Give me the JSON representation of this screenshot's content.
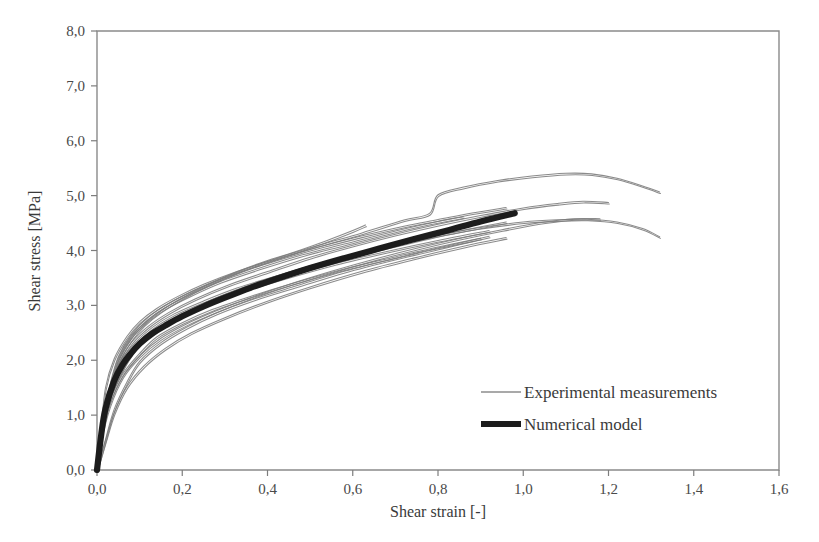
{
  "chart_data": {
    "type": "line",
    "title": "",
    "xlabel": "Shear strain [-]",
    "ylabel": "Shear stress [MPa]",
    "xlim": [
      0.0,
      1.6
    ],
    "ylim": [
      0.0,
      8.0
    ],
    "xticks": [
      "0,0",
      "0,2",
      "0,4",
      "0,6",
      "0,8",
      "1,0",
      "1,2",
      "1,4",
      "1,6"
    ],
    "xtick_values": [
      0.0,
      0.2,
      0.4,
      0.6,
      0.8,
      1.0,
      1.2,
      1.4,
      1.6
    ],
    "yticks": [
      "0,0",
      "1,0",
      "2,0",
      "3,0",
      "4,0",
      "5,0",
      "6,0",
      "7,0",
      "8,0"
    ],
    "ytick_values": [
      0.0,
      1.0,
      2.0,
      3.0,
      4.0,
      5.0,
      6.0,
      7.0,
      8.0
    ],
    "grid": false,
    "legend_position": "center-right",
    "legend": [
      {
        "label": "Experimental measurements",
        "style": "thin-line",
        "color": "#8d8d8d"
      },
      {
        "label": "Numerical model",
        "style": "thick-line",
        "color": "#1c1c1c"
      }
    ],
    "series": [
      {
        "name": "Numerical model",
        "style": "thick-line",
        "color": "#1c1c1c",
        "x": [
          0.0,
          0.01,
          0.02,
          0.04,
          0.06,
          0.08,
          0.1,
          0.13,
          0.16,
          0.2,
          0.25,
          0.3,
          0.36,
          0.42,
          0.5,
          0.58,
          0.66,
          0.74,
          0.82,
          0.9,
          0.98
        ],
        "y": [
          0.0,
          0.65,
          1.12,
          1.62,
          1.92,
          2.13,
          2.3,
          2.49,
          2.63,
          2.8,
          2.98,
          3.14,
          3.32,
          3.48,
          3.68,
          3.86,
          4.03,
          4.2,
          4.36,
          4.53,
          4.68
        ]
      },
      {
        "name": "Experimental measurement 1",
        "style": "thin-line",
        "color": "#7b7b7b",
        "x": [
          0.0,
          0.01,
          0.03,
          0.05,
          0.08,
          0.11,
          0.15,
          0.2,
          0.26,
          0.34,
          0.42,
          0.52,
          0.62,
          0.72,
          0.78,
          0.8,
          0.86,
          0.94,
          1.02,
          1.1,
          1.16,
          1.22,
          1.28,
          1.32
        ],
        "y": [
          0.0,
          0.72,
          1.45,
          1.95,
          2.36,
          2.63,
          2.88,
          3.12,
          3.36,
          3.62,
          3.84,
          4.08,
          4.3,
          4.54,
          4.66,
          5.0,
          5.14,
          5.26,
          5.34,
          5.39,
          5.38,
          5.3,
          5.16,
          5.05
        ]
      },
      {
        "name": "Experimental measurement 2",
        "style": "thin-line",
        "color": "#7b7b7b",
        "x": [
          0.0,
          0.01,
          0.03,
          0.06,
          0.09,
          0.13,
          0.18,
          0.24,
          0.32,
          0.4,
          0.5,
          0.6,
          0.7,
          0.8,
          0.9,
          1.0,
          1.08,
          1.15,
          1.22,
          1.28,
          1.32
        ],
        "y": [
          0.0,
          0.66,
          1.32,
          1.84,
          2.2,
          2.5,
          2.76,
          3.0,
          3.26,
          3.48,
          3.72,
          3.93,
          4.12,
          4.28,
          4.42,
          4.52,
          4.56,
          4.57,
          4.52,
          4.4,
          4.25
        ]
      },
      {
        "name": "Experimental measurement 3",
        "style": "thin-line",
        "color": "#7b7b7b",
        "x": [
          0.0,
          0.01,
          0.03,
          0.05,
          0.08,
          0.12,
          0.17,
          0.23,
          0.3,
          0.38,
          0.46,
          0.54,
          0.6,
          0.63
        ],
        "y": [
          0.0,
          0.78,
          1.55,
          2.08,
          2.48,
          2.8,
          3.06,
          3.3,
          3.54,
          3.78,
          3.98,
          4.2,
          4.38,
          4.48
        ]
      },
      {
        "name": "Experimental measurement 4",
        "style": "thin-line",
        "color": "#7b7b7b",
        "x": [
          0.0,
          0.01,
          0.03,
          0.05,
          0.08,
          0.12,
          0.17,
          0.23,
          0.31,
          0.4,
          0.5,
          0.6,
          0.7,
          0.8,
          0.9,
          1.0,
          1.08,
          1.14,
          1.2
        ],
        "y": [
          0.0,
          0.7,
          1.4,
          1.9,
          2.3,
          2.6,
          2.86,
          3.1,
          3.36,
          3.6,
          3.86,
          4.08,
          4.28,
          4.46,
          4.62,
          4.76,
          4.84,
          4.88,
          4.86
        ]
      },
      {
        "name": "Experimental measurement 5",
        "style": "thin-line",
        "color": "#7b7b7b",
        "x": [
          0.0,
          0.01,
          0.03,
          0.06,
          0.1,
          0.15,
          0.21,
          0.28,
          0.36,
          0.45,
          0.55,
          0.65,
          0.75,
          0.85,
          0.95,
          1.05,
          1.12,
          1.18
        ],
        "y": [
          0.0,
          0.58,
          1.18,
          1.7,
          2.08,
          2.4,
          2.66,
          2.9,
          3.14,
          3.38,
          3.62,
          3.84,
          4.04,
          4.22,
          4.38,
          4.52,
          4.58,
          4.58
        ]
      },
      {
        "name": "Experimental measurement 6",
        "style": "thin-line",
        "color": "#7b7b7b",
        "x": [
          0.0,
          0.01,
          0.02,
          0.04,
          0.07,
          0.1,
          0.14,
          0.19,
          0.25,
          0.33,
          0.42,
          0.52,
          0.62,
          0.72,
          0.8,
          0.88,
          0.96
        ],
        "y": [
          0.0,
          0.82,
          1.52,
          2.04,
          2.45,
          2.72,
          2.96,
          3.18,
          3.4,
          3.64,
          3.86,
          4.08,
          4.28,
          4.46,
          4.58,
          4.7,
          4.8
        ]
      },
      {
        "name": "Experimental measurement 7",
        "style": "thin-line",
        "color": "#7b7b7b",
        "x": [
          0.0,
          0.02,
          0.04,
          0.07,
          0.11,
          0.16,
          0.22,
          0.3,
          0.4,
          0.5,
          0.62,
          0.74,
          0.86,
          0.96
        ],
        "y": [
          0.0,
          0.52,
          1.02,
          1.5,
          1.88,
          2.2,
          2.48,
          2.76,
          3.06,
          3.32,
          3.6,
          3.84,
          4.06,
          4.22
        ]
      },
      {
        "name": "Experimental measurement 8",
        "style": "thin-line",
        "color": "#7b7b7b",
        "x": [
          0.0,
          0.01,
          0.03,
          0.05,
          0.09,
          0.13,
          0.18,
          0.25,
          0.33,
          0.43,
          0.54,
          0.66,
          0.78,
          0.88,
          0.96
        ],
        "y": [
          0.0,
          0.74,
          1.42,
          1.92,
          2.32,
          2.6,
          2.84,
          3.08,
          3.32,
          3.56,
          3.8,
          4.02,
          4.24,
          4.4,
          4.52
        ]
      },
      {
        "name": "Experimental measurement 9",
        "style": "thin-line",
        "color": "#7b7b7b",
        "x": [
          0.0,
          0.01,
          0.03,
          0.06,
          0.1,
          0.14,
          0.2,
          0.27,
          0.36,
          0.46,
          0.58,
          0.7,
          0.8,
          0.9
        ],
        "y": [
          0.0,
          0.62,
          1.26,
          1.76,
          2.14,
          2.44,
          2.7,
          2.94,
          3.18,
          3.42,
          3.68,
          3.9,
          4.08,
          4.24
        ]
      },
      {
        "name": "Experimental measurement 10",
        "style": "thin-line",
        "color": "#7b7b7b",
        "x": [
          0.0,
          0.01,
          0.03,
          0.05,
          0.08,
          0.12,
          0.16,
          0.22,
          0.29,
          0.38,
          0.48,
          0.58,
          0.68,
          0.78,
          0.86
        ],
        "y": [
          0.0,
          0.8,
          1.5,
          2.02,
          2.42,
          2.72,
          2.94,
          3.18,
          3.42,
          3.66,
          3.9,
          4.1,
          4.3,
          4.48,
          4.6
        ]
      },
      {
        "name": "Experimental measurement 11",
        "style": "thin-line",
        "color": "#7b7b7b",
        "x": [
          0.0,
          0.02,
          0.04,
          0.07,
          0.1,
          0.15,
          0.21,
          0.28,
          0.37,
          0.47,
          0.58,
          0.7,
          0.82,
          0.92
        ],
        "y": [
          0.0,
          0.56,
          1.1,
          1.6,
          1.98,
          2.32,
          2.6,
          2.86,
          3.12,
          3.36,
          3.62,
          3.86,
          4.08,
          4.26
        ]
      },
      {
        "name": "Experimental measurement 12",
        "style": "thin-line",
        "color": "#7b7b7b",
        "x": [
          0.0,
          0.01,
          0.03,
          0.06,
          0.09,
          0.14,
          0.19,
          0.26,
          0.34,
          0.44,
          0.56,
          0.68,
          0.8,
          0.92
        ],
        "y": [
          0.0,
          0.68,
          1.36,
          1.86,
          2.24,
          2.55,
          2.8,
          3.04,
          3.28,
          3.52,
          3.78,
          4.0,
          4.2,
          4.38
        ]
      }
    ]
  }
}
